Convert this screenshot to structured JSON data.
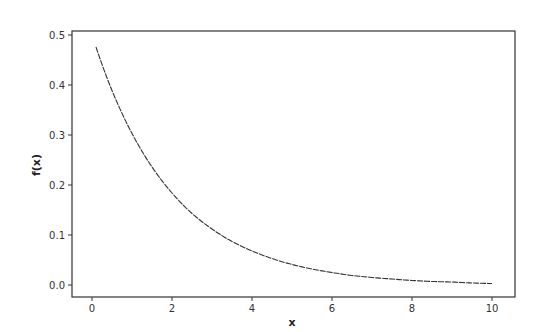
{
  "chart_data": {
    "type": "line",
    "title": "",
    "xlabel": "x",
    "ylabel": "f(x)",
    "xlim": [
      -0.5,
      10.6
    ],
    "ylim": [
      -0.025,
      0.508
    ],
    "xticks": [
      0,
      2,
      4,
      6,
      8,
      10
    ],
    "xtick_labels": [
      "0",
      "2",
      "4",
      "6",
      "8",
      "10"
    ],
    "yticks": [
      0.0,
      0.1,
      0.2,
      0.3,
      0.4,
      0.5
    ],
    "ytick_labels": [
      "0.0",
      "0.1",
      "0.2",
      "0.3",
      "0.4",
      "0.5"
    ],
    "grid": false,
    "legend": null,
    "series": [
      {
        "name": "f(x)",
        "color": "#333333",
        "x": [
          0.1,
          0.5,
          1,
          1.5,
          2,
          2.5,
          3,
          3.5,
          4,
          4.5,
          5,
          5.5,
          6,
          6.5,
          7,
          7.5,
          8,
          8.5,
          9,
          9.5,
          10
        ],
        "y": [
          0.476,
          0.389,
          0.303,
          0.236,
          0.184,
          0.143,
          0.112,
          0.087,
          0.068,
          0.053,
          0.041,
          0.032,
          0.025,
          0.019,
          0.015,
          0.012,
          0.009,
          0.007,
          0.006,
          0.004,
          0.003
        ]
      }
    ]
  }
}
